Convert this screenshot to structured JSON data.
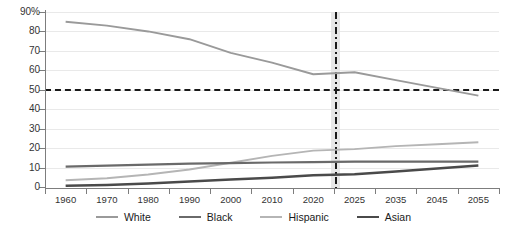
{
  "chart_data": {
    "type": "line",
    "title": "",
    "subtitle": "",
    "xlabel": "",
    "ylabel": "",
    "ylim": [
      0,
      90
    ],
    "grid": true,
    "legend_position": "bottom",
    "axis_type": "categorical-uneven-years",
    "categories": [
      "1960",
      "1970",
      "1980",
      "1990",
      "2000",
      "2010",
      "2020",
      "2025",
      "2035",
      "2045",
      "2055"
    ],
    "x_tick_labels": [
      "1960",
      "1970",
      "1980",
      "1990",
      "2000",
      "2010",
      "2020",
      "2025",
      "2035",
      "2045",
      "2055"
    ],
    "y_tick_labels": [
      "0",
      "10",
      "20",
      "30",
      "40",
      "50",
      "60",
      "70",
      "80",
      "90%"
    ],
    "y_tick_values": [
      0,
      10,
      20,
      30,
      40,
      50,
      60,
      70,
      80,
      90
    ],
    "series": [
      {
        "name": "White",
        "color": "#9a9a9a",
        "values": [
          85,
          83,
          80,
          76,
          69,
          64,
          58,
          59,
          55,
          51,
          47
        ]
      },
      {
        "name": "Black",
        "color": "#6a6a6a",
        "values": [
          10.5,
          11,
          11.5,
          12,
          12.3,
          12.6,
          12.8,
          13,
          13,
          13,
          13
        ]
      },
      {
        "name": "Hispanic",
        "color": "#b5b5b5",
        "values": [
          3.5,
          4.5,
          6.4,
          9,
          12.5,
          16,
          18.7,
          19.5,
          21,
          22,
          23
        ]
      },
      {
        "name": "Asian",
        "color": "#4a4a4a",
        "values": [
          0.6,
          1,
          1.8,
          2.8,
          3.8,
          4.8,
          6,
          6.5,
          8,
          9.5,
          11
        ]
      }
    ],
    "annotations": {
      "majority_threshold": {
        "type": "horizontal-dashed-line",
        "value": 50,
        "color": "#1a1a1a"
      },
      "present_year_marker": {
        "type": "vertical-dashdot-line",
        "category": "2020",
        "label": "",
        "color": "#1a1a1a",
        "band_color": "#e3e3e3"
      }
    }
  },
  "legend": {
    "items": [
      {
        "label": "White",
        "color": "#9a9a9a",
        "thickness": 2
      },
      {
        "label": "Black",
        "color": "#6a6a6a",
        "thickness": 2.4
      },
      {
        "label": "Hispanic",
        "color": "#b5b5b5",
        "thickness": 2
      },
      {
        "label": "Asian",
        "color": "#4a4a4a",
        "thickness": 2.6
      }
    ]
  },
  "axis": {
    "y_top_label": "90%",
    "y_labels": [
      "90%",
      "80",
      "70",
      "60",
      "50",
      "40",
      "30",
      "20",
      "10",
      "0"
    ],
    "x_labels": [
      "1960",
      "1970",
      "1980",
      "1990",
      "2000",
      "2010",
      "2020",
      "2025",
      "2035",
      "2045",
      "2055"
    ]
  }
}
